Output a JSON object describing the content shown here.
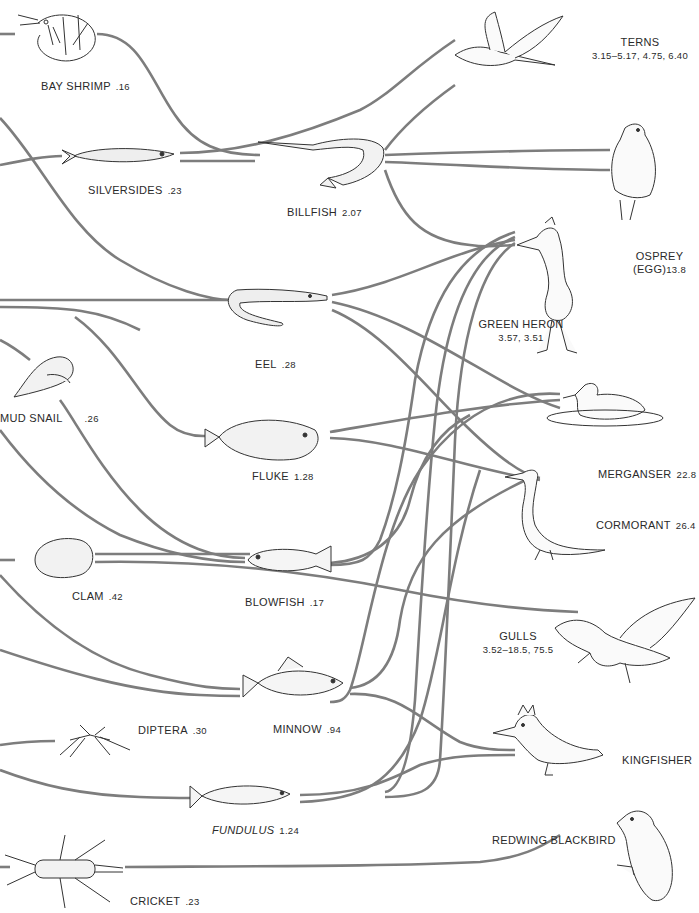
{
  "figure": {
    "link_color": "#7d7d7d",
    "ink_color": "#2a2a2a"
  },
  "prey": [
    {
      "id": "bay-shrimp",
      "name": "BAY SHRIMP",
      "value": ".16"
    },
    {
      "id": "silversides",
      "name": "SILVERSIDES",
      "value": ".23"
    },
    {
      "id": "billfish",
      "name": "BILLFISH",
      "value": "2.07"
    },
    {
      "id": "eel",
      "name": "EEL",
      "value": ".28"
    },
    {
      "id": "mud-snail",
      "name": "MUD SNAIL",
      "value": ".26"
    },
    {
      "id": "fluke",
      "name": "FLUKE",
      "value": "1.28"
    },
    {
      "id": "clam",
      "name": "CLAM",
      "value": ".42"
    },
    {
      "id": "blowfish",
      "name": "BLOWFISH",
      "value": ".17"
    },
    {
      "id": "diptera",
      "name": "DIPTERA",
      "value": ".30"
    },
    {
      "id": "minnow",
      "name": "MINNOW",
      "value": ".94"
    },
    {
      "id": "fundulus",
      "name": "FUNDULUS",
      "value": "1.24"
    },
    {
      "id": "cricket",
      "name": "CRICKET",
      "value": ".23"
    }
  ],
  "predators": [
    {
      "id": "terns",
      "name": "TERNS",
      "value": "3.15–5.17,  4.75,  6.40"
    },
    {
      "id": "osprey",
      "name": "OSPREY",
      "name2": "(EGG)",
      "value": "13.8"
    },
    {
      "id": "green-heron",
      "name": "GREEN HERON",
      "value": "3.57,  3.51"
    },
    {
      "id": "merganser",
      "name": "MERGANSER",
      "value": "22.8"
    },
    {
      "id": "cormorant",
      "name": "CORMORANT",
      "value": "26.4"
    },
    {
      "id": "gulls",
      "name": "GULLS",
      "value": "3.52–18.5,  75.5"
    },
    {
      "id": "kingfisher",
      "name": "KINGFISHER",
      "value": ""
    },
    {
      "id": "redwing-blackbird",
      "name": "REDWING BLACKBIRD",
      "value": ""
    }
  ]
}
